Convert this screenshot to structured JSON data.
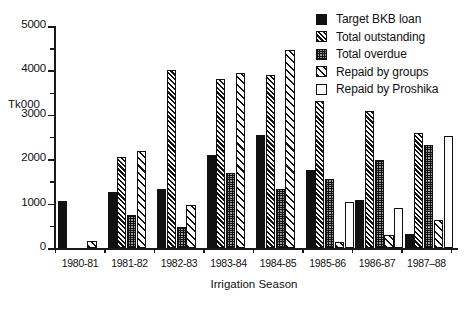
{
  "chart_data": {
    "type": "bar",
    "title": "",
    "xlabel": "Irrigation Season",
    "ylabel": "Tk000",
    "ylim": [
      0,
      5000
    ],
    "ytick_labels": [
      "0",
      "1000",
      "2000",
      "3000",
      "4000",
      "5000"
    ],
    "ytick_values": [
      0,
      1000,
      2000,
      3000,
      4000,
      5000
    ],
    "minor_tick_step": 500,
    "grid": false,
    "legend_position": "top-right",
    "categories": [
      "1980-81",
      "1981-82",
      "1982-83",
      "1983-84",
      "1984-85",
      "1985-86",
      "1986-87",
      "1987–88"
    ],
    "series": [
      {
        "name": "Target BKB loan",
        "pattern": "solid-black",
        "values": [
          1060,
          1270,
          1330,
          2100,
          2540,
          1750,
          1080,
          310
        ]
      },
      {
        "name": "Total outstanding",
        "pattern": "dense-diagonal-hatch",
        "values": [
          null,
          2050,
          4010,
          3810,
          3890,
          3320,
          3090,
          2600
        ]
      },
      {
        "name": "Total overdue",
        "pattern": "checkered-gray",
        "values": [
          null,
          750,
          480,
          1680,
          1340,
          1560,
          1990,
          2320
        ]
      },
      {
        "name": "Repaid by groups",
        "pattern": "sparse-diagonal-hatch",
        "values": [
          150,
          2180,
          960,
          3950,
          4460,
          130,
          290,
          630
        ]
      },
      {
        "name": "Repaid by Proshika",
        "pattern": "white",
        "values": [
          null,
          null,
          null,
          null,
          null,
          1030,
          890,
          2530
        ]
      }
    ]
  },
  "legend": {
    "items": [
      {
        "label": "Target BKB loan"
      },
      {
        "label": "Total outstanding"
      },
      {
        "label": "Total overdue"
      },
      {
        "label": "Repaid by groups"
      },
      {
        "label": "Repaid by Proshika"
      }
    ]
  }
}
